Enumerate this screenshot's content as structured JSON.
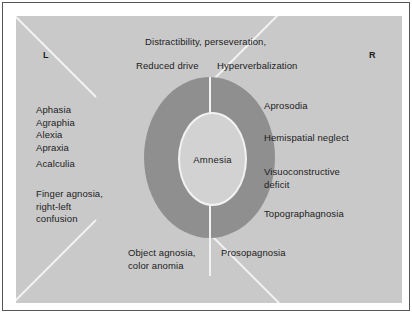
{
  "figure": {
    "type": "neuroanatomical-deficit-diagram",
    "hemispheres": {
      "left_label": "L",
      "right_label": "R"
    },
    "center": {
      "label": "Amnesia"
    },
    "top": {
      "line1": "Distractibility, perseveration,",
      "left_item": "Reduced drive",
      "right_item": "Hyperverbalization"
    },
    "left_column": {
      "group1": "Aphasia\nAgraphia\nAlexia\nApraxia",
      "group2": "Acalculia",
      "group3": "Finger agnosia,\nright-left\nconfusion"
    },
    "right_column": {
      "item1": "Aprosodia",
      "item2": "Hemispatial neglect",
      "item3": "Visuoconstructive\ndeficit",
      "item4": "Topographagnosia"
    },
    "bottom": {
      "left_item": "Object agnosia,\ncolor anomia",
      "right_item": "Prosopagnosia"
    },
    "colors": {
      "panel_background": "#c9c9c9",
      "ring_fill": "#8f8f8f",
      "center_fill": "#d2d2d2",
      "divider": "#f2f2f2",
      "frame": "#56565a",
      "text": "#1c1c1c"
    }
  }
}
